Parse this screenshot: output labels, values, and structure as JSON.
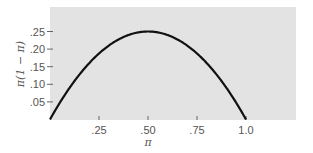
{
  "chart_data": {
    "type": "line",
    "title": "",
    "xlabel": "π",
    "ylabel": "π(1 − π)",
    "xlim": [
      0,
      1.2
    ],
    "ylim": [
      0,
      0.32
    ],
    "grid": false,
    "x_ticks": [
      0.25,
      0.5,
      0.75,
      1.0
    ],
    "x_tick_labels": [
      ".25",
      ".50",
      ".75",
      "1.0"
    ],
    "y_ticks": [
      0.05,
      0.1,
      0.15,
      0.2,
      0.25
    ],
    "y_tick_labels": [
      ".05",
      ".10",
      ".15",
      ".20",
      ".25"
    ],
    "series": [
      {
        "name": "π(1 − π)",
        "x": [
          0,
          0.05,
          0.1,
          0.15,
          0.2,
          0.25,
          0.3,
          0.35,
          0.4,
          0.45,
          0.5,
          0.55,
          0.6,
          0.65,
          0.7,
          0.75,
          0.8,
          0.85,
          0.9,
          0.95,
          1.0
        ],
        "values": [
          0,
          0.0475,
          0.09,
          0.1275,
          0.16,
          0.1875,
          0.21,
          0.2275,
          0.24,
          0.2475,
          0.25,
          0.2475,
          0.24,
          0.2275,
          0.21,
          0.1875,
          0.16,
          0.1275,
          0.09,
          0.0475,
          0
        ]
      }
    ],
    "colors": {
      "plot_background": "#e3e3e3",
      "curve": "#111111",
      "text": "#555555"
    }
  }
}
